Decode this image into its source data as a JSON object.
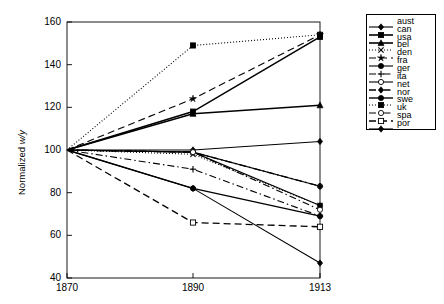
{
  "chart_data": {
    "type": "line",
    "title": "",
    "xlabel": "",
    "ylabel": "Normalized w/y",
    "x": [
      1870,
      1890,
      1913
    ],
    "xtick_labels": [
      "1870",
      "1890",
      "1913"
    ],
    "ytick_labels": [
      "40",
      "60",
      "80",
      "100",
      "120",
      "140",
      "160"
    ],
    "yticks": [
      40,
      60,
      80,
      100,
      120,
      140,
      160
    ],
    "ylim": [
      40,
      160
    ],
    "xlim": [
      1870,
      1913
    ],
    "grid": false,
    "legend_position": "right-outside",
    "series": [
      {
        "name": "aust",
        "values": [
          100,
          100,
          104
        ],
        "color": "#000000",
        "dash": "none",
        "marker": "diamond-filled",
        "width": 1.1
      },
      {
        "name": "can",
        "values": [
          100,
          118,
          153
        ],
        "color": "#000000",
        "dash": "none",
        "marker": "square-filled",
        "width": 1.6
      },
      {
        "name": "usa",
        "values": [
          100,
          117,
          121
        ],
        "color": "#000000",
        "dash": "none",
        "marker": "triangle-filled",
        "width": 1.6
      },
      {
        "name": "bel",
        "values": [
          100,
          98,
          74
        ],
        "color": "#000000",
        "dash": "dotted",
        "marker": "cross",
        "width": 1.1
      },
      {
        "name": "den",
        "values": [
          100,
          124,
          154
        ],
        "color": "#000000",
        "dash": "dashed",
        "marker": "star",
        "width": 1.1
      },
      {
        "name": "fra",
        "values": [
          100,
          99,
          74
        ],
        "color": "#000000",
        "dash": "none",
        "marker": "circle-filled",
        "width": 1.1
      },
      {
        "name": "ger",
        "values": [
          100,
          91,
          69
        ],
        "color": "#000000",
        "dash": "dashdot",
        "marker": "plus",
        "width": 1.1
      },
      {
        "name": "ita",
        "values": [
          100,
          99,
          83
        ],
        "color": "#000000",
        "dash": "none",
        "marker": "circle-open",
        "width": 1.1
      },
      {
        "name": "net",
        "values": [
          100,
          99,
          83
        ],
        "color": "#000000",
        "dash": "dashdot",
        "marker": "diamond-filled",
        "width": 1.3
      },
      {
        "name": "nor",
        "values": [
          100,
          82,
          69
        ],
        "color": "#000000",
        "dash": "none",
        "marker": "circle-filled",
        "width": 1.4
      },
      {
        "name": "swe",
        "values": [
          100,
          149,
          154
        ],
        "color": "#000000",
        "dash": "dotted",
        "marker": "square-filled",
        "width": 1.1
      },
      {
        "name": "uk",
        "values": [
          100,
          99,
          72
        ],
        "color": "#000000",
        "dash": "dashdot",
        "marker": "circle-open",
        "width": 1.1
      },
      {
        "name": "spa",
        "values": [
          100,
          66,
          64
        ],
        "color": "#000000",
        "dash": "dashed",
        "marker": "square-open",
        "width": 1.3
      },
      {
        "name": "por",
        "values": [
          100,
          82,
          47
        ],
        "color": "#000000",
        "dash": "none",
        "marker": "diamond-filled",
        "width": 1.1
      }
    ]
  },
  "axes": {
    "ylabel": "Normalized w/y",
    "ylabel_prefix": "Normalized ",
    "ylabel_italic": "w/y"
  },
  "legend": {
    "items": [
      {
        "label": "aust"
      },
      {
        "label": "can"
      },
      {
        "label": "usa"
      },
      {
        "label": "bel"
      },
      {
        "label": "den"
      },
      {
        "label": "fra"
      },
      {
        "label": "ger"
      },
      {
        "label": "ita"
      },
      {
        "label": "net"
      },
      {
        "label": "nor"
      },
      {
        "label": "swe"
      },
      {
        "label": "uk"
      },
      {
        "label": "spa"
      },
      {
        "label": "por"
      }
    ]
  }
}
